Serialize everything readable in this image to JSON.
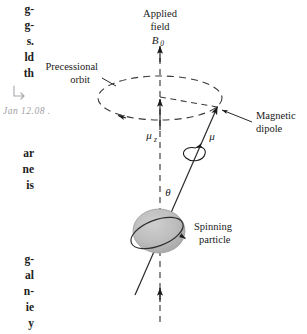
{
  "figure": {
    "type": "physics-vector-diagram"
  },
  "labels": {
    "applied_field_line1": "Applied",
    "applied_field_line2": "field",
    "applied_field_symbol": "B",
    "applied_field_subscript": "0",
    "precessional_orbit_line1": "Precessional",
    "precessional_orbit_line2": "orbit",
    "magnetic_dipole_line1": "Magnetic",
    "magnetic_dipole_line2": "dipole",
    "spinning_particle_line1": "Spinning",
    "spinning_particle_line2": "particle",
    "mu_z_symbol": "μ",
    "mu_z_subscript": "z",
    "mu_symbol": "μ",
    "theta_symbol": "θ"
  },
  "margin_text": {
    "fragments_top": [
      "g-",
      "g-",
      "s.",
      "ld",
      "th"
    ],
    "fragments_middle": [
      "ar",
      "ne",
      "is"
    ],
    "fragments_bottom": [
      "g-",
      "al",
      "n-",
      "ie",
      "y"
    ],
    "handwritten_note": "Jan 12.08 ."
  },
  "colors": {
    "ink": "#1a1a1a",
    "sphere_fill": "#b9b9b9",
    "sphere_stroke": "#4a4a4a",
    "dashed_stroke": "#3a3a3a",
    "page_background": "#ffffff",
    "handwriting": "#8f8f97"
  },
  "geometry": {
    "axis_x": 160,
    "axis_top_y": 44,
    "axis_bottom_y": 322,
    "ellipse_center": [
      160,
      98
    ],
    "ellipse_rx": 62,
    "ellipse_ry": 22,
    "dipole_tip": [
      218,
      108
    ],
    "sphere_center": [
      159,
      231
    ],
    "sphere_rx": 26,
    "sphere_ry": 22
  }
}
